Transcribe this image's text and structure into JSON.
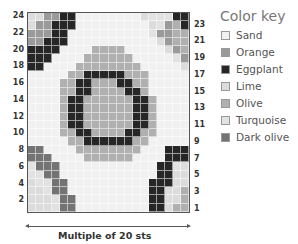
{
  "chart_data": {
    "type": "heatmap",
    "title": "",
    "columns": 20,
    "rows": 24,
    "row_labels_left": [
      "24",
      "22",
      "20",
      "18",
      "16",
      "14",
      "12",
      "10",
      "8",
      "6",
      "4",
      "2"
    ],
    "row_labels_right": [
      "23",
      "21",
      "19",
      "17",
      "15",
      "13",
      "11",
      "9",
      "7",
      "5",
      "3",
      "1"
    ],
    "xlabel": "Multiple of 20 sts",
    "legend": {
      "title": "Color key",
      "entries": [
        {
          "code": "S",
          "name": "Sand",
          "color": "#f1f1f1"
        },
        {
          "code": "O",
          "name": "Orange",
          "color": "#9a9a9a"
        },
        {
          "code": "E",
          "name": "Eggplant",
          "color": "#262626"
        },
        {
          "code": "L",
          "name": "Lime",
          "color": "#dcdcdc"
        },
        {
          "code": "V",
          "name": "Olive",
          "color": "#b0b0b0"
        },
        {
          "code": "T",
          "name": "Turquoise",
          "color": "#e2e2e2"
        },
        {
          "code": "D",
          "name": "Dark olive",
          "color": "#737373"
        }
      ]
    },
    "grid_top_to_bottom": [
      "LLOOEESSSSSSSSLTTTEE",
      "LOOEEESSSSSSSSSLTOVE",
      "OOOEESSSSSSSSSSTOOVV",
      "OOEEESSSSSSSSSSSLOVV",
      "EEEESSSSVVVVSSSSSLOV",
      "EEESSSSVVVVVVSSSSSTO",
      "EESSSSVVVVVVVVSSSSSL",
      "SSSSSVVEEEEEVVVSSSSS",
      "SSSSVVEEVVVEEVVSSSSS",
      "SSSSVVEEVVVVEEVSSSSS",
      "SSSSVEEVVVVVVEEVSSSS",
      "SSSSVEEVVVVVVEEVSSSS",
      "SSSSVEEVVVVVVEEVSSSS",
      "SSSSVEEVVVVVVEEVSSSS",
      "SSSSVVEEVVVVEEVVSSSS",
      "SSSSSVVEEEEEEVVSSSSS",
      "DDSSSSVVVVVVVVSSSEEE",
      "DDDSSSSVVVVVVSSSSEEE",
      "TDDDSSSSSSSSSSSSEETL",
      "TTDDSSSSSSSSSSSSEELL",
      "LTTDDSSSSSSSSSSEEELL",
      "LLTDDSSSSSSSSSSEELLV",
      "LLLTDDSSSSSSSSSEELLV",
      "LLLTDDSSSSSSSSSEELVV"
    ]
  },
  "legend": {
    "title": "Color key",
    "items": [
      "Sand",
      "Orange",
      "Eggplant",
      "Lime",
      "Olive",
      "Turquoise",
      "Dark olive"
    ]
  },
  "caption": "Multiple of 20 sts"
}
